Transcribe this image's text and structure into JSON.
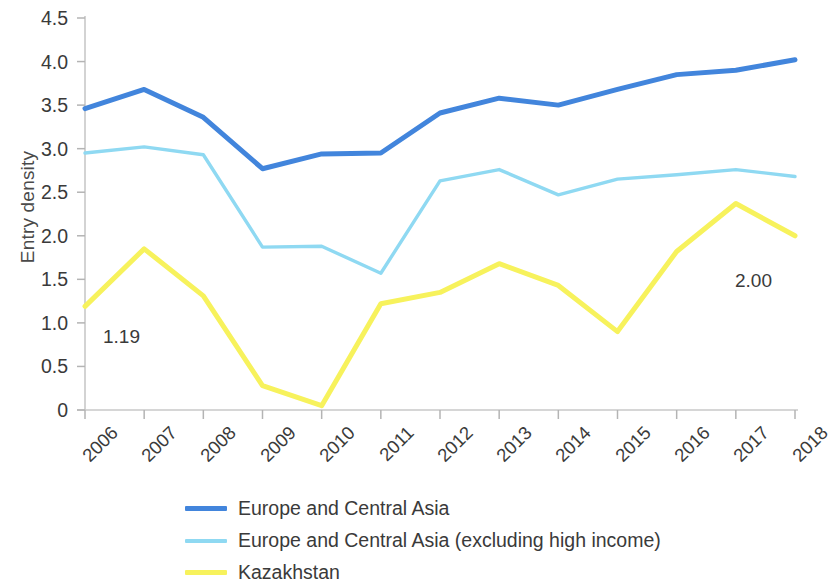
{
  "chart_data": {
    "type": "line",
    "title": "",
    "xlabel": "",
    "ylabel": "Entry density",
    "x": [
      2006,
      2007,
      2008,
      2009,
      2010,
      2011,
      2012,
      2013,
      2014,
      2015,
      2016,
      2017,
      2018
    ],
    "categories": [
      "2006",
      "2007",
      "2008",
      "2009",
      "2010",
      "2011",
      "2012",
      "2013",
      "2014",
      "2015",
      "2016",
      "2017",
      "2018"
    ],
    "ylim": [
      0,
      4.5
    ],
    "yticks": [
      0,
      0.5,
      1.0,
      1.5,
      2.0,
      2.5,
      3.0,
      3.5,
      4.0,
      4.5
    ],
    "ytick_labels": [
      "0",
      "0.5",
      "1.0",
      "1.5",
      "2.0",
      "2.5",
      "3.0",
      "3.5",
      "4.0",
      "4.5"
    ],
    "grid": false,
    "legend_position": "bottom",
    "series": [
      {
        "name": "Europe and Central Asia",
        "color": "#4285dc",
        "width": 5,
        "values": [
          3.46,
          3.68,
          3.36,
          2.77,
          2.94,
          2.95,
          3.41,
          3.58,
          3.5,
          3.68,
          3.85,
          3.9,
          4.02
        ]
      },
      {
        "name": "Europe and Central Asia (excluding high income)",
        "color": "#8fd9f2",
        "width": 3.4,
        "values": [
          2.95,
          3.02,
          2.93,
          1.87,
          1.88,
          1.57,
          2.63,
          2.76,
          2.47,
          2.65,
          2.7,
          2.76,
          2.68
        ]
      },
      {
        "name": "Kazakhstan",
        "color": "#f7f25c",
        "width": 5,
        "values": [
          1.19,
          1.85,
          1.31,
          0.28,
          0.05,
          1.22,
          1.35,
          1.68,
          1.43,
          0.9,
          1.82,
          2.37,
          2.0
        ]
      }
    ],
    "annotations": [
      {
        "text": "1.19",
        "x": 2006,
        "y": 1.19,
        "series": "Kazakhstan",
        "dx": 18,
        "dy": 20
      },
      {
        "text": "2.00",
        "x": 2018,
        "y": 2.0,
        "series": "Kazakhstan",
        "dx": -60,
        "dy": 34
      }
    ]
  },
  "axes": {
    "axis_color": "#c8c8c8",
    "tick_color": "#b4b4b4",
    "text_color": "#3a3a3a"
  },
  "geometry": {
    "plot_left": 85,
    "plot_right": 795,
    "plot_top": 18,
    "plot_bottom": 410
  }
}
